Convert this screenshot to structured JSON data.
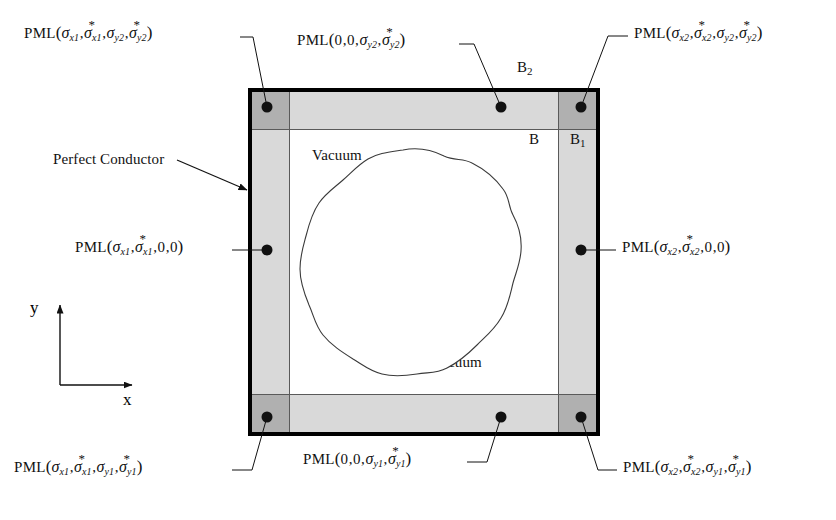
{
  "figure": {
    "type": "schematic-diagram"
  },
  "domain_box": {
    "outer_border_label": "Perfect Conductor",
    "outer_border_color": "#000000",
    "pml_side_color": "#d9d9d9",
    "pml_corner_color": "#b0b0b0",
    "interior_color": "#ffffff"
  },
  "interior": {
    "source_label": "Source",
    "vacuum_label_top": "Vacuum",
    "vacuum_label_bottom": "Vacuum"
  },
  "boundary_labels": {
    "b_outer_top": "B",
    "b_outer_top_sub": "2",
    "b_inner": "B",
    "b_outer_right": "B",
    "b_outer_right_sub": "1"
  },
  "annotations": {
    "perfect_conductor": "Perfect Conductor"
  },
  "axes": {
    "x_label": "x",
    "y_label": "y"
  },
  "pml_labels": [
    {
      "id": "top-left-corner",
      "prefix": "PML",
      "args": [
        {
          "kind": "sigma",
          "sub": "x1",
          "star": false
        },
        {
          "kind": "sigma",
          "sub": "x1",
          "star": true
        },
        {
          "kind": "sigma",
          "sub": "y2",
          "star": false
        },
        {
          "kind": "sigma",
          "sub": "y2",
          "star": true
        }
      ],
      "plain": "PML(sigma_x1, sigma*_x1, sigma_y2, sigma*_y2)"
    },
    {
      "id": "top-edge",
      "prefix": "PML",
      "args": [
        {
          "kind": "zero",
          "text": "0"
        },
        {
          "kind": "zero",
          "text": "0"
        },
        {
          "kind": "sigma",
          "sub": "y2",
          "star": false
        },
        {
          "kind": "sigma",
          "sub": "y2",
          "star": true
        }
      ],
      "plain": "PML(0,0, sigma_y2, sigma*_y2)"
    },
    {
      "id": "top-right-corner",
      "prefix": "PML",
      "args": [
        {
          "kind": "sigma",
          "sub": "x2",
          "star": false
        },
        {
          "kind": "sigma",
          "sub": "x2",
          "star": true
        },
        {
          "kind": "sigma",
          "sub": "y2",
          "star": false
        },
        {
          "kind": "sigma",
          "sub": "y2",
          "star": true
        }
      ],
      "plain": "PML(sigma_x2, sigma*_x2, sigma_y2, sigma*_y2)"
    },
    {
      "id": "left-edge",
      "prefix": "PML",
      "args": [
        {
          "kind": "sigma",
          "sub": "x1",
          "star": false
        },
        {
          "kind": "sigma",
          "sub": "x1",
          "star": true
        },
        {
          "kind": "zero",
          "text": "0"
        },
        {
          "kind": "zero",
          "text": "0"
        }
      ],
      "plain": "PML(sigma_x1, sigma*_x1, 0,0)"
    },
    {
      "id": "right-edge",
      "prefix": "PML",
      "args": [
        {
          "kind": "sigma",
          "sub": "x2",
          "star": false
        },
        {
          "kind": "sigma",
          "sub": "x2",
          "star": true
        },
        {
          "kind": "zero",
          "text": "0"
        },
        {
          "kind": "zero",
          "text": "0"
        }
      ],
      "plain": "PML(sigma_x2, sigma*_x2, 0,0)"
    },
    {
      "id": "bottom-left-corner",
      "prefix": "PML",
      "args": [
        {
          "kind": "sigma",
          "sub": "x1",
          "star": false
        },
        {
          "kind": "sigma",
          "sub": "x1",
          "star": true
        },
        {
          "kind": "sigma",
          "sub": "y1",
          "star": false
        },
        {
          "kind": "sigma",
          "sub": "y1",
          "star": true
        }
      ],
      "plain": "PML(sigma_x1, sigma*_x1, sigma_y1, sigma*_y1)"
    },
    {
      "id": "bottom-edge",
      "prefix": "PML",
      "args": [
        {
          "kind": "zero",
          "text": "0"
        },
        {
          "kind": "zero",
          "text": "0"
        },
        {
          "kind": "sigma",
          "sub": "y1",
          "star": false
        },
        {
          "kind": "sigma",
          "sub": "y1",
          "star": true
        }
      ],
      "plain": "PML(0,0, sigma_y1, sigma*_y1)"
    },
    {
      "id": "bottom-right-corner",
      "prefix": "PML",
      "args": [
        {
          "kind": "sigma",
          "sub": "x2",
          "star": false
        },
        {
          "kind": "sigma",
          "sub": "x2",
          "star": true
        },
        {
          "kind": "sigma",
          "sub": "y1",
          "star": false
        },
        {
          "kind": "sigma",
          "sub": "y1",
          "star": true
        }
      ],
      "plain": "PML(sigma_x2, sigma*_x2, sigma_y1, sigma*_y1)"
    }
  ],
  "glyphs": {
    "sigma": "σ",
    "star": "*",
    "open_paren": "(",
    "close_paren": ")",
    "comma": ","
  }
}
